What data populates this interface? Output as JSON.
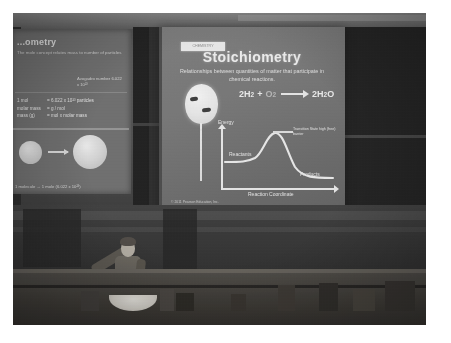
{
  "photo": {
    "scene": "lecture-hall-photograph",
    "description": "Grainy photograph of a university lecture hall with a projected chemistry slide and a lecturer gesturing toward the screen"
  },
  "main_slide": {
    "tag_label": "CHEMISTRY",
    "title": "Stoichiometry",
    "subtitle": "Relationships between quantities of matter that participate in chemical reactions.",
    "equation": {
      "reactant1": "2H",
      "reactant1_sub": "2",
      "plus": "+",
      "reactant2": "O",
      "reactant2_sub": "2",
      "arrow": "→",
      "product": "2H",
      "product_sub": "2",
      "product_tail": "O"
    },
    "diagram": {
      "y_axis_label": "Energy",
      "x_axis_label": "Reaction Coordinate",
      "reactants_label": "Reactants",
      "products_label": "Products",
      "transition_label": "Transition State high (free) barrier"
    },
    "balloon_label": "hydrogen balloon",
    "credit": "© 2011 Pearson Education, Inc."
  },
  "side_slide": {
    "title": "...ometry",
    "subtitle": "The mole concept relates mass to number of particles",
    "note": "Avogadro number 6.022 x 10²³",
    "rows": [
      {
        "label": "1 mol",
        "value": "= 6.022 x 10²³ particles"
      },
      {
        "label": "molar mass",
        "value": "= g / mol"
      },
      {
        "label": "mass (g)",
        "value": "= mol x molar mass"
      }
    ],
    "caption": "1 molecule  →  1 mole (6.022 x 10²³)"
  },
  "lecturer": {
    "label": "lecturer pointing at screen"
  },
  "colors": {
    "photo_border": "#ffffff",
    "screen_light": "#7e7e7e",
    "slide_text": "#f5f5f5",
    "wall_dark": "#1e1e1e",
    "bench": "#3b3833"
  }
}
